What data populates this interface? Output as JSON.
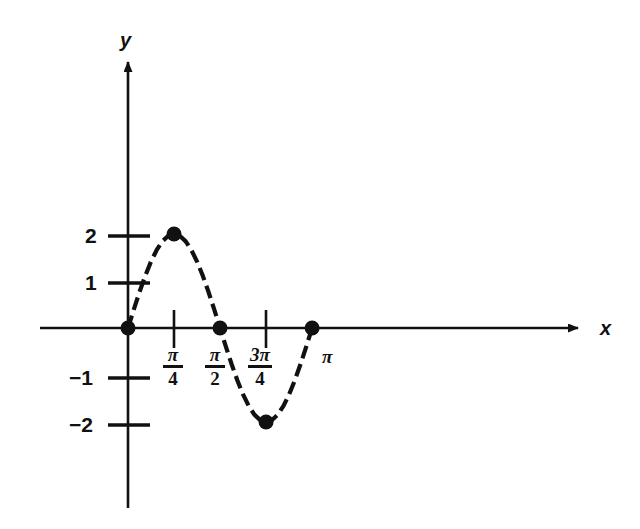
{
  "chart_data": {
    "type": "line",
    "title": "",
    "subtitle": "",
    "xlabel": "x",
    "ylabel": "y",
    "function": "y = 2 sin 2x",
    "grid": false,
    "legend": "none",
    "linestyle": "dashed",
    "xlim": [
      0,
      3.5
    ],
    "ylim": [
      -2.6,
      2.6
    ],
    "x_tick_labels": [
      "π/4",
      "π/2",
      "3π/4",
      "π"
    ],
    "x_tick_values": [
      0.7853981634,
      1.5707963268,
      2.3561944902,
      3.1415926536
    ],
    "y_tick_labels": [
      "2",
      "1",
      "−1",
      "−2"
    ],
    "y_tick_values": [
      2,
      1,
      -1,
      -2
    ],
    "marked_points": [
      {
        "label": "origin",
        "x": 0,
        "y": 0
      },
      {
        "label": "maximum",
        "x": 0.7853981634,
        "y": 2
      },
      {
        "label": "zero-at-pi-over-2",
        "x": 1.5707963268,
        "y": 0
      },
      {
        "label": "minimum",
        "x": 2.3561944902,
        "y": -2
      },
      {
        "label": "zero-at-pi",
        "x": 3.1415926536,
        "y": 0
      }
    ],
    "x": [
      0,
      0.0982,
      0.1963,
      0.2945,
      0.3927,
      0.4909,
      0.589,
      0.6872,
      0.7854,
      0.8836,
      0.9817,
      1.0799,
      1.1781,
      1.2763,
      1.3744,
      1.4726,
      1.5708,
      1.669,
      1.7671,
      1.8653,
      1.9635,
      2.0617,
      2.1598,
      2.258,
      2.3562,
      2.4544,
      2.5525,
      2.6507,
      2.7489,
      2.8471,
      2.9452,
      3.0434,
      3.1416
    ],
    "y": [
      0,
      0.3902,
      0.7654,
      1.1111,
      1.4142,
      1.6629,
      1.8478,
      1.9616,
      2,
      1.9616,
      1.8478,
      1.6629,
      1.4142,
      1.1111,
      0.7654,
      0.3902,
      0,
      -0.3902,
      -0.7654,
      -1.1111,
      -1.4142,
      -1.6629,
      -1.8478,
      -1.9616,
      -2,
      -1.9616,
      -1.8478,
      -1.6629,
      -1.4142,
      -1.1111,
      -0.7654,
      -0.3902,
      0
    ]
  },
  "axes": {
    "y_axis_label": "y",
    "x_axis_label": "x"
  },
  "labels": {
    "y_tick_2": "2",
    "y_tick_1": "1",
    "y_tick_neg1": "−1",
    "y_tick_neg2": "−2",
    "pi_over_4_num": "π",
    "pi_over_4_den": "4",
    "pi_over_2_num": "π",
    "pi_over_2_den": "2",
    "three_pi_over_4_num": "3π",
    "three_pi_over_4_den": "4",
    "pi_label": "π"
  },
  "colors": {
    "ink": "#111111",
    "background": "#ffffff"
  }
}
